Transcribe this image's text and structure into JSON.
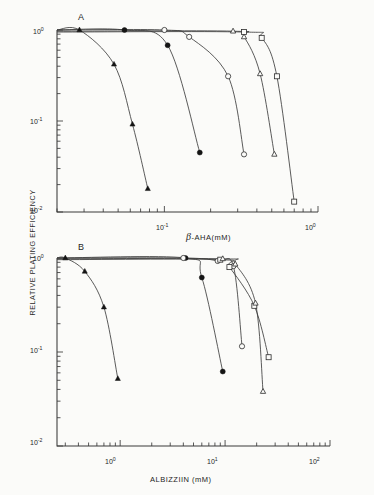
{
  "figure": {
    "ylabel": "RELATIVE PLATING EFFICIENCY",
    "panelA_letter": "A",
    "panelB_letter": "B",
    "panelA_xlabel_symbol": "β",
    "panelA_xlabel_text": "-AHA(mM)",
    "panelB_xlabel": "ALBIZZIIN  (mM)",
    "y_tick_labels": [
      "10",
      "10",
      "10"
    ],
    "y_tick_exponents": [
      "0",
      "-1",
      "-2"
    ],
    "panelA_x_tick_labels": [
      "10",
      "10"
    ],
    "panelA_x_tick_exponents": [
      "-1",
      "0"
    ],
    "panelB_x_tick_labels": [
      "10",
      "10",
      "10"
    ],
    "panelB_x_tick_exponents": [
      "0",
      "1",
      "2"
    ]
  },
  "chart_data": [
    {
      "type": "line",
      "title": "A",
      "xlabel": "β-AHA (mM)",
      "ylabel": "Relative plating efficiency",
      "xscale": "log",
      "yscale": "log",
      "xlim": [
        0.02,
        1.0
      ],
      "ylim": [
        0.01,
        1.0
      ],
      "grid": false,
      "legend": "none",
      "series": [
        {
          "name": "filled-triangle",
          "marker": "filled-triangle",
          "x": [
            0.028,
            0.047,
            0.062,
            0.078
          ],
          "y": [
            1.0,
            0.42,
            0.092,
            0.018
          ]
        },
        {
          "name": "filled-circle",
          "marker": "filled-circle",
          "x": [
            0.055,
            0.105,
            0.17
          ],
          "y": [
            1.0,
            0.68,
            0.045
          ]
        },
        {
          "name": "open-circle",
          "marker": "open-circle",
          "x": [
            0.1,
            0.145,
            0.26,
            0.33
          ],
          "y": [
            1.0,
            0.84,
            0.31,
            0.043
          ]
        },
        {
          "name": "open-triangle",
          "marker": "open-triangle",
          "x": [
            0.28,
            0.33,
            0.42,
            0.52
          ],
          "y": [
            0.97,
            0.84,
            0.33,
            0.043
          ]
        },
        {
          "name": "open-square",
          "marker": "open-square",
          "x": [
            0.33,
            0.43,
            0.54,
            0.7
          ],
          "y": [
            0.95,
            0.82,
            0.31,
            0.013
          ]
        }
      ]
    },
    {
      "type": "line",
      "title": "B",
      "xlabel": "ALBIZZIIN (mM)",
      "ylabel": "Relative plating efficiency",
      "xscale": "log",
      "yscale": "log",
      "xlim": [
        0.25,
        100.0
      ],
      "ylim": [
        0.01,
        1.0
      ],
      "grid": false,
      "legend": "none",
      "series": [
        {
          "name": "filled-triangle",
          "marker": "filled-triangle",
          "x": [
            0.3,
            0.46,
            0.7,
            0.95
          ],
          "y": [
            1.0,
            0.72,
            0.3,
            0.052
          ]
        },
        {
          "name": "filled-circle",
          "marker": "filled-circle",
          "x": [
            4.2,
            6.0,
            9.5
          ],
          "y": [
            1.0,
            0.62,
            0.062
          ]
        },
        {
          "name": "open-circle",
          "marker": "open-circle",
          "x": [
            4.0,
            8.5,
            12.0,
            14.5
          ],
          "y": [
            1.0,
            0.93,
            0.82,
            0.115
          ]
        },
        {
          "name": "open-square",
          "marker": "open-square",
          "x": [
            9.0,
            11.0,
            19.0,
            26.0
          ],
          "y": [
            0.96,
            0.8,
            0.31,
            0.088
          ]
        },
        {
          "name": "open-triangle",
          "marker": "open-triangle",
          "x": [
            9.5,
            12.5,
            19.5,
            23.0
          ],
          "y": [
            0.98,
            0.86,
            0.33,
            0.038
          ]
        }
      ]
    }
  ]
}
